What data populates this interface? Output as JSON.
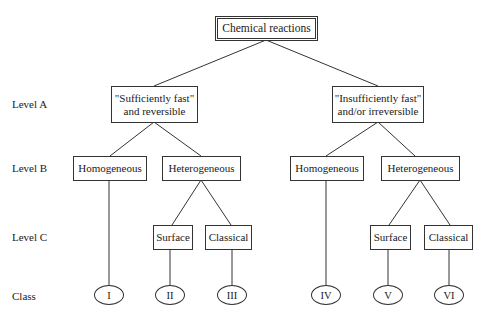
{
  "root": {
    "label": "Chemical reactions"
  },
  "levels": {
    "a": "Level A",
    "b": "Level B",
    "c": "Level C",
    "class": "Class"
  },
  "level_a": {
    "left": {
      "line1": "\"Sufficiently fast\"",
      "line2": "and reversible"
    },
    "right": {
      "line1": "\"Insufficiently fast\"",
      "line2": "and/or irreversible"
    }
  },
  "level_b": {
    "left_homogeneous": "Homogeneous",
    "left_heterogeneous": "Heterogeneous",
    "right_homogeneous": "Homogeneous",
    "right_heterogeneous": "Heterogeneous"
  },
  "level_c": {
    "left_surface": "Surface",
    "left_classical": "Classical",
    "right_surface": "Surface",
    "right_classical": "Classical"
  },
  "classes": [
    "I",
    "II",
    "III",
    "IV",
    "V",
    "VI"
  ]
}
